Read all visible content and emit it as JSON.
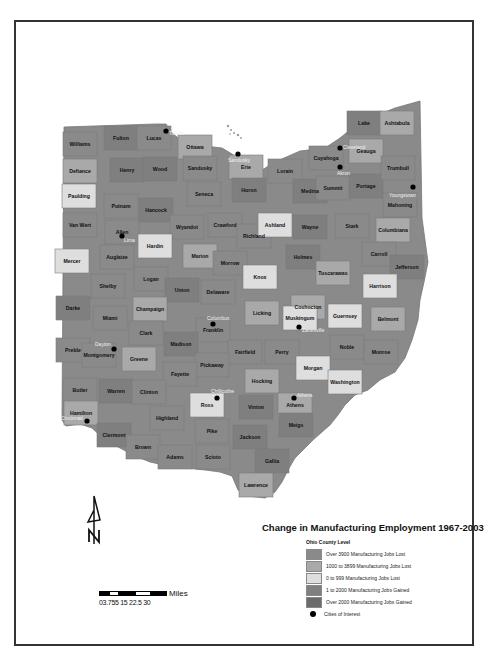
{
  "title": "Change in Manufacturing Employment 1967-2003",
  "legend": {
    "subtitle": "Ohio County Level",
    "items": [
      {
        "label": "Over 3900 Manufacturing Jobs Lost",
        "color": "#8a8a8a"
      },
      {
        "label": "1000 to 3899 Manufacturing Jobs Lost",
        "color": "#a9a9a9"
      },
      {
        "label": "0 to 999 Manufacturing Jobs Lost",
        "color": "#dedede"
      },
      {
        "label": "1 to 2000 Manufacturing Jobs Gained",
        "color": "#7f7f7f"
      },
      {
        "label": "Over 2000 Manufacturing Jobs Gained",
        "color": "#6b6b6b"
      }
    ],
    "cities_label": "Cities of Interest"
  },
  "scale": {
    "units": "Miles",
    "ticks": "0 3.75 7.5 15 22.5 30",
    "ticks_rendered": "03.755 15 22.5 30"
  },
  "north_arrow": {
    "letter": "N"
  },
  "counties": [
    {
      "name": "Williams",
      "x": 80,
      "y": 144,
      "c": "#8a8a8a"
    },
    {
      "name": "Fulton",
      "x": 121,
      "y": 138,
      "c": "#7f7f7f"
    },
    {
      "name": "Lucas",
      "x": 154,
      "y": 138,
      "c": "#8a8a8a"
    },
    {
      "name": "Ottawa",
      "x": 195,
      "y": 147,
      "c": "#a9a9a9"
    },
    {
      "name": "Defiance",
      "x": 80,
      "y": 171,
      "c": "#a9a9a9"
    },
    {
      "name": "Henry",
      "x": 127,
      "y": 170,
      "c": "#7f7f7f"
    },
    {
      "name": "Wood",
      "x": 160,
      "y": 169,
      "c": "#7f7f7f"
    },
    {
      "name": "Sandusky",
      "x": 200,
      "y": 168,
      "c": "#8a8a8a"
    },
    {
      "name": "Erie",
      "x": 246,
      "y": 167,
      "c": "#a9a9a9"
    },
    {
      "name": "Lorain",
      "x": 285,
      "y": 171,
      "c": "#8a8a8a"
    },
    {
      "name": "Cuyahoga",
      "x": 326,
      "y": 158,
      "c": "#8a8a8a"
    },
    {
      "name": "Lake",
      "x": 364,
      "y": 123,
      "c": "#7f7f7f"
    },
    {
      "name": "Ashtabula",
      "x": 397,
      "y": 123,
      "c": "#a9a9a9"
    },
    {
      "name": "Geauga",
      "x": 366,
      "y": 151,
      "c": "#a9a9a9"
    },
    {
      "name": "Paulding",
      "x": 79,
      "y": 196,
      "c": "#dedede"
    },
    {
      "name": "Putnam",
      "x": 121,
      "y": 206,
      "c": "#8a8a8a"
    },
    {
      "name": "Hancock",
      "x": 156,
      "y": 210,
      "c": "#7f7f7f"
    },
    {
      "name": "Seneca",
      "x": 204,
      "y": 194,
      "c": "#8a8a8a"
    },
    {
      "name": "Huron",
      "x": 249,
      "y": 190,
      "c": "#7f7f7f"
    },
    {
      "name": "Medina",
      "x": 310,
      "y": 191,
      "c": "#7f7f7f"
    },
    {
      "name": "Summit",
      "x": 333,
      "y": 188,
      "c": "#8a8a8a"
    },
    {
      "name": "Portage",
      "x": 366,
      "y": 186,
      "c": "#7f7f7f"
    },
    {
      "name": "Trumbull",
      "x": 398,
      "y": 168,
      "c": "#8a8a8a"
    },
    {
      "name": "Mahoning",
      "x": 400,
      "y": 205,
      "c": "#8a8a8a"
    },
    {
      "name": "Van Wert",
      "x": 80,
      "y": 225,
      "c": "#8a8a8a"
    },
    {
      "name": "Allen",
      "x": 122,
      "y": 232,
      "c": "#8a8a8a"
    },
    {
      "name": "Wyandot",
      "x": 187,
      "y": 227,
      "c": "#8a8a8a"
    },
    {
      "name": "Crawford",
      "x": 225,
      "y": 225,
      "c": "#8a8a8a"
    },
    {
      "name": "Richland",
      "x": 254,
      "y": 236,
      "c": "#8a8a8a"
    },
    {
      "name": "Ashland",
      "x": 275,
      "y": 225,
      "c": "#dedede"
    },
    {
      "name": "Wayne",
      "x": 310,
      "y": 227,
      "c": "#7f7f7f"
    },
    {
      "name": "Stark",
      "x": 352,
      "y": 226,
      "c": "#8a8a8a"
    },
    {
      "name": "Columbiana",
      "x": 393,
      "y": 230,
      "c": "#a9a9a9"
    },
    {
      "name": "Mercer",
      "x": 72,
      "y": 261,
      "c": "#dedede"
    },
    {
      "name": "Hardin",
      "x": 155,
      "y": 246,
      "c": "#dedede"
    },
    {
      "name": "Auglaize",
      "x": 117,
      "y": 257,
      "c": "#8a8a8a"
    },
    {
      "name": "Marion",
      "x": 200,
      "y": 256,
      "c": "#a9a9a9"
    },
    {
      "name": "Morrow",
      "x": 230,
      "y": 263,
      "c": "#8a8a8a"
    },
    {
      "name": "Holmes",
      "x": 303,
      "y": 257,
      "c": "#7f7f7f"
    },
    {
      "name": "Carroll",
      "x": 379,
      "y": 254,
      "c": "#8a8a8a"
    },
    {
      "name": "Jefferson",
      "x": 407,
      "y": 267,
      "c": "#7f7f7f"
    },
    {
      "name": "Shelby",
      "x": 108,
      "y": 286,
      "c": "#8a8a8a"
    },
    {
      "name": "Logan",
      "x": 151,
      "y": 279,
      "c": "#8a8a8a"
    },
    {
      "name": "Union",
      "x": 182,
      "y": 290,
      "c": "#7f7f7f"
    },
    {
      "name": "Delaware",
      "x": 218,
      "y": 292,
      "c": "#8a8a8a"
    },
    {
      "name": "Knox",
      "x": 260,
      "y": 277,
      "c": "#dedede"
    },
    {
      "name": "Tuscarawas",
      "x": 333,
      "y": 273,
      "c": "#a9a9a9"
    },
    {
      "name": "Harrison",
      "x": 380,
      "y": 286,
      "c": "#dedede"
    },
    {
      "name": "Darke",
      "x": 73,
      "y": 308,
      "c": "#7f7f7f"
    },
    {
      "name": "Miami",
      "x": 110,
      "y": 318,
      "c": "#8a8a8a"
    },
    {
      "name": "Champaign",
      "x": 150,
      "y": 309,
      "c": "#a9a9a9"
    },
    {
      "name": "Coshocton",
      "x": 308,
      "y": 307,
      "c": "#a9a9a9"
    },
    {
      "name": "Licking",
      "x": 262,
      "y": 313,
      "c": "#a9a9a9"
    },
    {
      "name": "Guernsey",
      "x": 345,
      "y": 316,
      "c": "#dedede"
    },
    {
      "name": "Belmont",
      "x": 388,
      "y": 319,
      "c": "#a9a9a9"
    },
    {
      "name": "Franklin",
      "x": 213,
      "y": 330,
      "c": "#8a8a8a"
    },
    {
      "name": "Clark",
      "x": 146,
      "y": 333,
      "c": "#8a8a8a"
    },
    {
      "name": "Muskingum",
      "x": 300,
      "y": 318,
      "c": "#dedede"
    },
    {
      "name": "Madison",
      "x": 181,
      "y": 344,
      "c": "#7f7f7f"
    },
    {
      "name": "Preble",
      "x": 73,
      "y": 350,
      "c": "#8a8a8a"
    },
    {
      "name": "Montgomery",
      "x": 99,
      "y": 355,
      "c": "#8a8a8a"
    },
    {
      "name": "Greene",
      "x": 139,
      "y": 359,
      "c": "#a9a9a9"
    },
    {
      "name": "Noble",
      "x": 347,
      "y": 347,
      "c": "#8a8a8a"
    },
    {
      "name": "Monroe",
      "x": 381,
      "y": 352,
      "c": "#8a8a8a"
    },
    {
      "name": "Fairfield",
      "x": 245,
      "y": 352,
      "c": "#8a8a8a"
    },
    {
      "name": "Perry",
      "x": 282,
      "y": 352,
      "c": "#8a8a8a"
    },
    {
      "name": "Pickaway",
      "x": 212,
      "y": 365,
      "c": "#8a8a8a"
    },
    {
      "name": "Fayette",
      "x": 180,
      "y": 374,
      "c": "#8a8a8a"
    },
    {
      "name": "Morgan",
      "x": 313,
      "y": 368,
      "c": "#dedede"
    },
    {
      "name": "Washington",
      "x": 345,
      "y": 382,
      "c": "#dedede"
    },
    {
      "name": "Butler",
      "x": 80,
      "y": 390,
      "c": "#8a8a8a"
    },
    {
      "name": "Warren",
      "x": 116,
      "y": 391,
      "c": "#7f7f7f"
    },
    {
      "name": "Clinton",
      "x": 149,
      "y": 392,
      "c": "#8a8a8a"
    },
    {
      "name": "Hocking",
      "x": 262,
      "y": 381,
      "c": "#a9a9a9"
    },
    {
      "name": "Ross",
      "x": 207,
      "y": 405,
      "c": "#dedede"
    },
    {
      "name": "Vinton",
      "x": 256,
      "y": 407,
      "c": "#7f7f7f"
    },
    {
      "name": "Athens",
      "x": 295,
      "y": 405,
      "c": "#a9a9a9"
    },
    {
      "name": "Hamilton",
      "x": 81,
      "y": 413,
      "c": "#a9a9a9"
    },
    {
      "name": "Highland",
      "x": 167,
      "y": 418,
      "c": "#8a8a8a"
    },
    {
      "name": "Meigs",
      "x": 296,
      "y": 425,
      "c": "#7f7f7f"
    },
    {
      "name": "Clermont",
      "x": 114,
      "y": 435,
      "c": "#7f7f7f"
    },
    {
      "name": "Pike",
      "x": 212,
      "y": 431,
      "c": "#8a8a8a"
    },
    {
      "name": "Jackson",
      "x": 250,
      "y": 437,
      "c": "#7f7f7f"
    },
    {
      "name": "Brown",
      "x": 143,
      "y": 447,
      "c": "#8a8a8a"
    },
    {
      "name": "Adams",
      "x": 175,
      "y": 457,
      "c": "#8a8a8a"
    },
    {
      "name": "Scioto",
      "x": 213,
      "y": 457,
      "c": "#8a8a8a"
    },
    {
      "name": "Gallia",
      "x": 272,
      "y": 461,
      "c": "#7f7f7f"
    },
    {
      "name": "Lawrence",
      "x": 256,
      "y": 485,
      "c": "#a9a9a9"
    }
  ],
  "cities": [
    {
      "name": "Toledo",
      "x": 166,
      "y": 131,
      "lx": 169,
      "ly": 135
    },
    {
      "name": "Sandusky",
      "x": 238,
      "y": 154,
      "lx": 228,
      "ly": 162
    },
    {
      "name": "Cleveland",
      "x": 340,
      "y": 148,
      "lx": 343,
      "ly": 149
    },
    {
      "name": "Akron",
      "x": 340,
      "y": 167,
      "lx": 337,
      "ly": 175
    },
    {
      "name": "Youngstown",
      "x": 413,
      "y": 187,
      "lx": 389,
      "ly": 197
    },
    {
      "name": "Lima",
      "x": 122,
      "y": 236,
      "lx": 124,
      "ly": 242
    },
    {
      "name": "Columbus",
      "x": 213,
      "y": 324,
      "lx": 207,
      "ly": 320
    },
    {
      "name": "Zanesville",
      "x": 299,
      "y": 327,
      "lx": 302,
      "ly": 332
    },
    {
      "name": "Dayton",
      "x": 114,
      "y": 349,
      "lx": 95,
      "ly": 346
    },
    {
      "name": "Cincinnati",
      "x": 87,
      "y": 421,
      "lx": 61,
      "ly": 420
    },
    {
      "name": "Chillicothe",
      "x": 217,
      "y": 398,
      "lx": 211,
      "ly": 393
    },
    {
      "name": "Athens",
      "x": 294,
      "y": 398,
      "lx": 297,
      "ly": 397
    }
  ]
}
